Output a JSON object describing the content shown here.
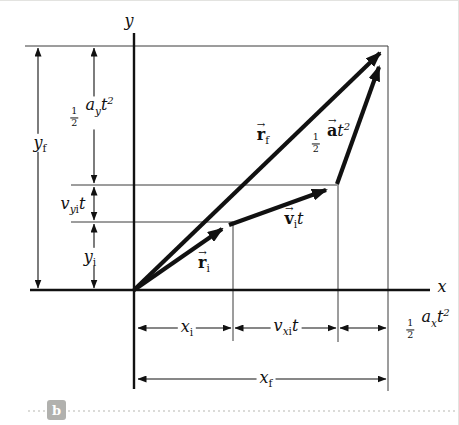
{
  "figure": {
    "panel_label": "b",
    "axes": {
      "x_label": "x",
      "y_label": "y"
    }
  },
  "vectors": {
    "r_i": {
      "accent": "→",
      "base": "r",
      "sub": "i"
    },
    "v_i_t": {
      "accent": "→",
      "base": "v",
      "sub": "i",
      "factor": "t"
    },
    "r_f": {
      "accent": "→",
      "base": "r",
      "sub": "f"
    },
    "half_a_t2": {
      "num": "1",
      "den": "2",
      "accent": "→",
      "base": "a",
      "var": "t",
      "exp": "2"
    }
  },
  "dimensions": {
    "y_f": {
      "base": "y",
      "sub": "f"
    },
    "half_ay_t2": {
      "num": "1",
      "den": "2",
      "base": "a",
      "sub": "y",
      "var": "t",
      "exp": "2"
    },
    "v_yi_t": {
      "base": "v",
      "sub_var": "y",
      "sub_idx": "i",
      "factor": "t"
    },
    "y_i": {
      "base": "y",
      "sub": "i"
    },
    "x_i": {
      "base": "x",
      "sub": "i"
    },
    "v_xi_t": {
      "base": "v",
      "sub_var": "x",
      "sub_idx": "i",
      "factor": "t"
    },
    "half_ax_t2": {
      "num": "1",
      "den": "2",
      "base": "a",
      "sub": "x",
      "var": "t",
      "exp": "2"
    },
    "x_f": {
      "base": "x",
      "sub": "f"
    }
  }
}
